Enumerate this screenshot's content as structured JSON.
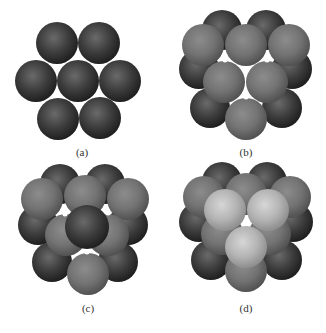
{
  "figure": {
    "panels": [
      {
        "id": "a",
        "label": "(a)",
        "label_pos": [
          82,
          146
        ],
        "description": "Single close-packed layer of 7 spheres (hexagonal arrangement)",
        "spheres": [
          {
            "x": 57,
            "y": 43,
            "r": 21,
            "shade": "dark"
          },
          {
            "x": 99,
            "y": 43,
            "r": 21,
            "shade": "dark"
          },
          {
            "x": 36,
            "y": 81,
            "r": 21,
            "shade": "dark"
          },
          {
            "x": 78,
            "y": 81,
            "r": 21,
            "shade": "dark"
          },
          {
            "x": 120,
            "y": 81,
            "r": 21,
            "shade": "dark"
          },
          {
            "x": 58,
            "y": 119,
            "r": 21,
            "shade": "dark"
          },
          {
            "x": 100,
            "y": 118,
            "r": 21,
            "shade": "dark"
          }
        ]
      },
      {
        "id": "b",
        "label": "(b)",
        "label_pos": [
          246,
          146
        ],
        "description": "Second layer (medium gray) placed in hollows of first layer; small white voids visible",
        "spheres": [
          {
            "x": 222,
            "y": 30,
            "r": 20,
            "shade": "dark"
          },
          {
            "x": 266,
            "y": 30,
            "r": 20,
            "shade": "dark"
          },
          {
            "x": 199,
            "y": 69,
            "r": 20,
            "shade": "dark"
          },
          {
            "x": 292,
            "y": 69,
            "r": 20,
            "shade": "dark"
          },
          {
            "x": 210,
            "y": 108,
            "r": 20,
            "shade": "dark"
          },
          {
            "x": 282,
            "y": 108,
            "r": 20,
            "shade": "dark"
          },
          {
            "x": 203,
            "y": 45,
            "r": 21,
            "shade": "medium"
          },
          {
            "x": 246,
            "y": 45,
            "r": 21,
            "shade": "medium"
          },
          {
            "x": 289,
            "y": 45,
            "r": 21,
            "shade": "medium"
          },
          {
            "x": 224,
            "y": 82,
            "r": 21,
            "shade": "medium"
          },
          {
            "x": 267,
            "y": 82,
            "r": 21,
            "shade": "medium"
          },
          {
            "x": 246,
            "y": 119,
            "r": 21,
            "shade": "medium"
          }
        ],
        "voids": [
          {
            "x": 225,
            "y": 60,
            "r": 2.5
          },
          {
            "x": 267,
            "y": 60,
            "r": 2.5
          },
          {
            "x": 246,
            "y": 97,
            "r": 2.5
          }
        ]
      },
      {
        "id": "c",
        "label": "(c)",
        "label_pos": [
          88,
          302
        ],
        "description": "Third layer begins: one dark sphere placed directly above a first-layer sphere (ABA stacking / hcp)",
        "spheres": [
          {
            "x": 60,
            "y": 184,
            "r": 20,
            "shade": "dark"
          },
          {
            "x": 105,
            "y": 184,
            "r": 20,
            "shade": "dark"
          },
          {
            "x": 38,
            "y": 225,
            "r": 20,
            "shade": "dark"
          },
          {
            "x": 128,
            "y": 225,
            "r": 20,
            "shade": "dark"
          },
          {
            "x": 52,
            "y": 262,
            "r": 20,
            "shade": "dark"
          },
          {
            "x": 118,
            "y": 262,
            "r": 20,
            "shade": "dark"
          },
          {
            "x": 42,
            "y": 199,
            "r": 21,
            "shade": "medium"
          },
          {
            "x": 85,
            "y": 196,
            "r": 21,
            "shade": "medium"
          },
          {
            "x": 128,
            "y": 199,
            "r": 21,
            "shade": "medium"
          },
          {
            "x": 66,
            "y": 235,
            "r": 21,
            "shade": "medium"
          },
          {
            "x": 108,
            "y": 235,
            "r": 21,
            "shade": "medium"
          },
          {
            "x": 88,
            "y": 274,
            "r": 21,
            "shade": "medium"
          },
          {
            "x": 87,
            "y": 227,
            "r": 22,
            "shade": "dark"
          }
        ],
        "voids": [
          {
            "x": 65,
            "y": 214,
            "r": 2.5
          },
          {
            "x": 108,
            "y": 213,
            "r": 2.5
          },
          {
            "x": 87,
            "y": 252,
            "r": 2.5
          }
        ]
      },
      {
        "id": "d",
        "label": "(d)",
        "label_pos": [
          246,
          302
        ],
        "description": "Third layer of light spheres placed over second-layer voids (ABC stacking / ccp)",
        "spheres": [
          {
            "x": 222,
            "y": 182,
            "r": 20,
            "shade": "dark"
          },
          {
            "x": 267,
            "y": 182,
            "r": 20,
            "shade": "dark"
          },
          {
            "x": 199,
            "y": 222,
            "r": 20,
            "shade": "dark"
          },
          {
            "x": 293,
            "y": 222,
            "r": 20,
            "shade": "dark"
          },
          {
            "x": 211,
            "y": 260,
            "r": 20,
            "shade": "dark"
          },
          {
            "x": 282,
            "y": 260,
            "r": 20,
            "shade": "dark"
          },
          {
            "x": 204,
            "y": 197,
            "r": 21,
            "shade": "medium"
          },
          {
            "x": 246,
            "y": 194,
            "r": 21,
            "shade": "medium"
          },
          {
            "x": 290,
            "y": 197,
            "r": 21,
            "shade": "medium"
          },
          {
            "x": 222,
            "y": 234,
            "r": 21,
            "shade": "medium"
          },
          {
            "x": 270,
            "y": 234,
            "r": 21,
            "shade": "medium"
          },
          {
            "x": 246,
            "y": 271,
            "r": 21,
            "shade": "medium"
          },
          {
            "x": 225,
            "y": 210,
            "r": 21,
            "shade": "light"
          },
          {
            "x": 268,
            "y": 210,
            "r": 21,
            "shade": "light"
          },
          {
            "x": 246,
            "y": 247,
            "r": 21,
            "shade": "light"
          }
        ],
        "voids": []
      }
    ],
    "colors": {
      "background": "#ffffff",
      "dark_hi": "#6a6a6a",
      "dark_mid": "#3c3c3c",
      "dark_lo": "#1c1c1c",
      "medium_hi": "#8c8c8c",
      "medium_mid": "#737373",
      "medium_lo": "#4e4e4e",
      "light_hi": "#d6d6d6",
      "light_mid": "#b4b4b4",
      "light_lo": "#8a8a8a",
      "void": "#ffffff",
      "label": "#333333"
    }
  }
}
